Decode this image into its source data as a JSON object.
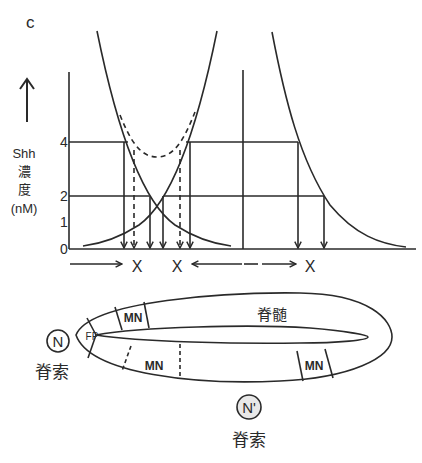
{
  "panel_label": "c",
  "y_axis": {
    "label_line1": "Shh",
    "label_line2": "濃",
    "label_line3": "度",
    "label_line4": "(nM)",
    "ticks": [
      "0",
      "1",
      "2",
      "4"
    ],
    "arrow": "↑"
  },
  "x_markers": [
    "X",
    "X",
    "X"
  ],
  "spinal_cord": {
    "label": "脊髄",
    "regions": [
      "FP",
      "MN",
      "MN",
      "MN"
    ]
  },
  "notochord_left": {
    "symbol": "N",
    "label": "脊索"
  },
  "notochord_bottom": {
    "symbol": "N'",
    "label": "脊索"
  },
  "colors": {
    "ink": "#2a2a2a",
    "background": "#ffffff"
  }
}
